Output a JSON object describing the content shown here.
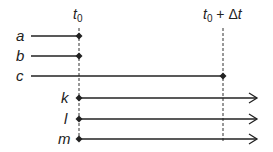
{
  "diagram": {
    "time_markers": [
      {
        "label_main": "t",
        "label_sub": "0",
        "label_rest": "",
        "x": 79
      },
      {
        "label_main": "t",
        "label_sub": "0",
        "label_rest": " + Δt",
        "x": 223
      }
    ],
    "lines": [
      {
        "label": "a",
        "y": 36,
        "x_start": 31,
        "x_end": 79,
        "start_dot": false,
        "end_dot": true,
        "arrow": false
      },
      {
        "label": "b",
        "y": 56,
        "x_start": 31,
        "x_end": 79,
        "start_dot": false,
        "end_dot": true,
        "arrow": false
      },
      {
        "label": "c",
        "y": 76,
        "x_start": 31,
        "x_end": 223,
        "start_dot": false,
        "end_dot": true,
        "arrow": false
      },
      {
        "label": "k",
        "y": 98,
        "x_start": 79,
        "x_end": 257,
        "start_dot": true,
        "end_dot": false,
        "arrow": true
      },
      {
        "label": "l",
        "y": 119,
        "x_start": 79,
        "x_end": 257,
        "start_dot": true,
        "end_dot": false,
        "arrow": true
      },
      {
        "label": "m",
        "y": 139,
        "x_start": 79,
        "x_end": 257,
        "start_dot": true,
        "end_dot": false,
        "arrow": true
      }
    ],
    "colors": {
      "stroke": "#222222",
      "background": "#ffffff"
    }
  }
}
